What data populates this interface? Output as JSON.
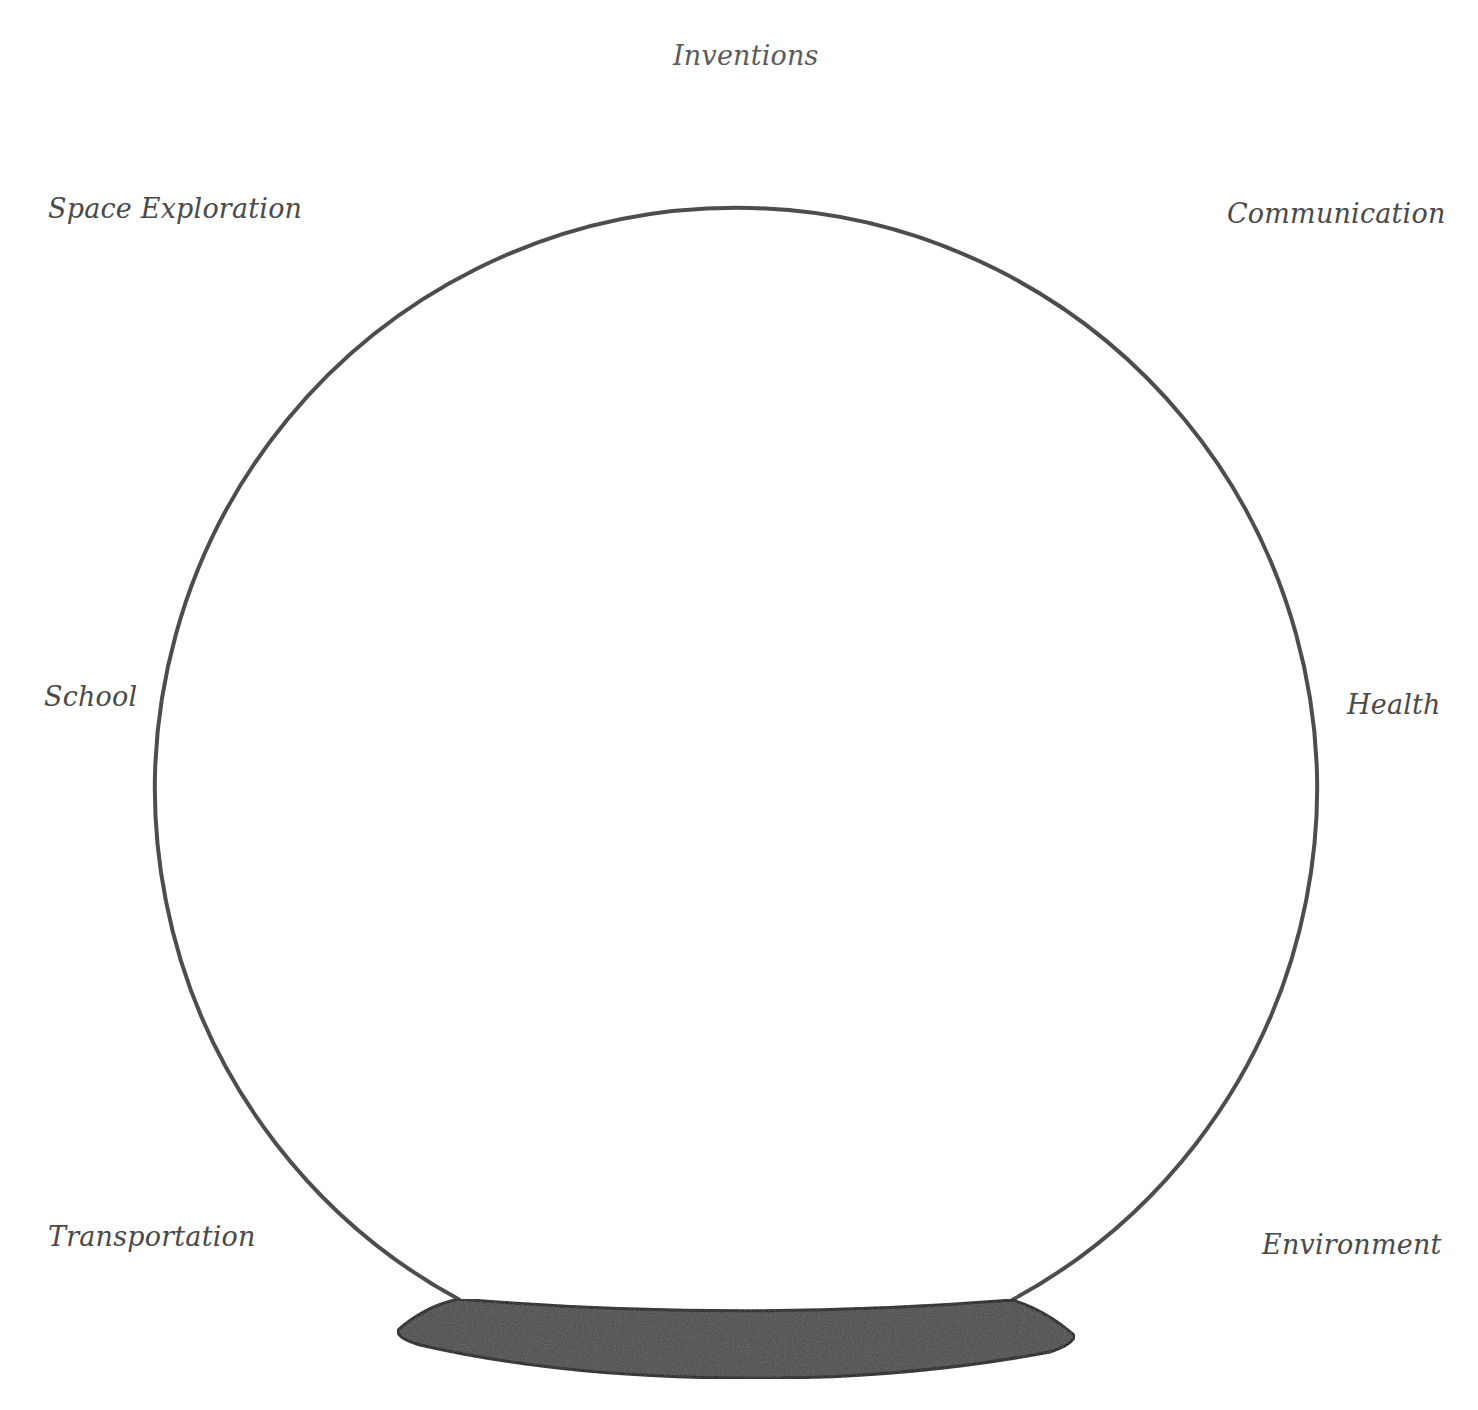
{
  "diagram": {
    "type": "crystal-ball-brainstorm",
    "globe": {
      "center_x": 737,
      "center_y": 746,
      "radius": 581,
      "stroke_color": "#4d4d4d"
    },
    "base": {
      "fill_color": "#4a4a4a",
      "stroke_color": "#111111"
    },
    "labels": {
      "top": "Inventions",
      "top_left": "Space Exploration",
      "top_right": "Communication",
      "middle_left": "School",
      "middle_right": "Health",
      "bottom_left": "Transportation",
      "bottom_right": "Environment"
    }
  }
}
